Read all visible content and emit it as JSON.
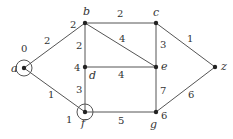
{
  "graph": {
    "nodes": [
      {
        "id": "a",
        "label": "a",
        "x": 24,
        "y": 68,
        "dist": "0",
        "circled": true,
        "label_pos": [
          11,
          72
        ],
        "dist_pos": [
          21,
          52
        ]
      },
      {
        "id": "b",
        "label": "b",
        "x": 85,
        "y": 23,
        "dist": "2",
        "circled": false,
        "label_pos": [
          83,
          15
        ],
        "dist_pos": [
          70,
          28
        ]
      },
      {
        "id": "c",
        "label": "c",
        "x": 156,
        "y": 23,
        "dist": "",
        "circled": false,
        "label_pos": [
          153,
          16
        ],
        "dist_pos": [
          0,
          0
        ]
      },
      {
        "id": "d",
        "label": "d",
        "x": 85,
        "y": 67,
        "dist": "4",
        "circled": false,
        "label_pos": [
          89,
          79
        ],
        "dist_pos": [
          74,
          71
        ]
      },
      {
        "id": "e",
        "label": "e",
        "x": 156,
        "y": 67,
        "dist": "",
        "circled": false,
        "label_pos": [
          161,
          70
        ],
        "dist_pos": [
          0,
          0
        ]
      },
      {
        "id": "f",
        "label": "f",
        "x": 85,
        "y": 112,
        "dist": "1",
        "circled": true,
        "label_pos": [
          81,
          127
        ],
        "dist_pos": [
          66,
          123
        ]
      },
      {
        "id": "g",
        "label": "g",
        "x": 156,
        "y": 112,
        "dist": "6",
        "circled": false,
        "label_pos": [
          150,
          128
        ],
        "dist_pos": [
          161,
          119
        ]
      },
      {
        "id": "z",
        "label": "z",
        "x": 215,
        "y": 67,
        "dist": "",
        "circled": false,
        "label_pos": [
          221,
          70
        ],
        "dist_pos": [
          0,
          0
        ]
      }
    ],
    "edges": [
      {
        "from": "a",
        "to": "b",
        "weight": "2",
        "label_pos": [
          44,
          44
        ]
      },
      {
        "from": "a",
        "to": "f",
        "weight": "1",
        "label_pos": [
          48,
          98
        ]
      },
      {
        "from": "b",
        "to": "c",
        "weight": "2",
        "label_pos": [
          117,
          17
        ]
      },
      {
        "from": "b",
        "to": "d",
        "weight": "2",
        "label_pos": [
          76,
          49
        ]
      },
      {
        "from": "b",
        "to": "e",
        "weight": "4",
        "label_pos": [
          119,
          42
        ]
      },
      {
        "from": "c",
        "to": "e",
        "weight": "3",
        "label_pos": [
          160,
          48
        ]
      },
      {
        "from": "c",
        "to": "z",
        "weight": "1",
        "label_pos": [
          187,
          42
        ]
      },
      {
        "from": "d",
        "to": "e",
        "weight": "4",
        "label_pos": [
          118,
          78
        ]
      },
      {
        "from": "d",
        "to": "f",
        "weight": "3",
        "label_pos": [
          76,
          93
        ]
      },
      {
        "from": "e",
        "to": "g",
        "weight": "7",
        "label_pos": [
          160,
          94
        ]
      },
      {
        "from": "f",
        "to": "g",
        "weight": "5",
        "label_pos": [
          118,
          124
        ]
      },
      {
        "from": "g",
        "to": "z",
        "weight": "6",
        "label_pos": [
          188,
          98
        ]
      }
    ]
  },
  "colors": {
    "line": "#555555",
    "node": "#222222",
    "text": "#333333",
    "background": "#ffffff"
  }
}
